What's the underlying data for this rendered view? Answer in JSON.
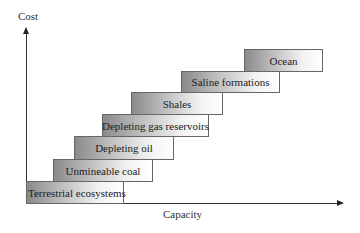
{
  "diagram": {
    "type": "staircase",
    "y_axis_label": "Cost",
    "x_axis_label": "Capacity",
    "steps": [
      {
        "label": "Terrestrial ecosystems",
        "left": 26,
        "top": 181,
        "width": 98,
        "height": 23
      },
      {
        "label": "Unmineable coal",
        "left": 53,
        "top": 159,
        "width": 100,
        "height": 23
      },
      {
        "label": "Depleting oil",
        "left": 74,
        "top": 136,
        "width": 100,
        "height": 24
      },
      {
        "label": "Depleting gas reservoirs",
        "left": 102,
        "top": 114,
        "width": 107,
        "height": 23
      },
      {
        "label": "Shales",
        "left": 131,
        "top": 92,
        "width": 92,
        "height": 23
      },
      {
        "label": "Saline formations",
        "left": 181,
        "top": 71,
        "width": 99,
        "height": 22
      },
      {
        "label": "Ocean",
        "left": 244,
        "top": 49,
        "width": 79,
        "height": 23
      }
    ]
  }
}
